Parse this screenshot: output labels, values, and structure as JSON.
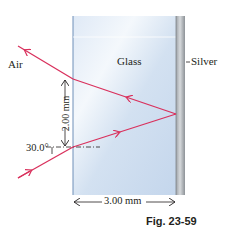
{
  "figure": {
    "caption": "Fig. 23-59",
    "regions": {
      "air_label": "Air",
      "glass_label": "Glass",
      "silver_label": "Silver"
    },
    "dimensions": {
      "vertical_separation": "2.00 mm",
      "glass_thickness": "3.00 mm"
    },
    "angles": {
      "incidence_angle": "30.0°"
    },
    "colors": {
      "ray": "#d9305c",
      "glass_light": "#eef4fb",
      "glass_mid": "#c9daee",
      "glass_edge": "#6f8fb8",
      "silver_light": "#c9cccf",
      "silver_dark": "#8c9196",
      "text": "#231f20"
    }
  }
}
